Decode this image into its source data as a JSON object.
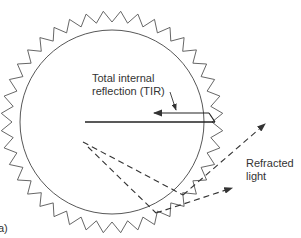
{
  "diagram": {
    "labels": {
      "tir_line1": "Total internal",
      "tir_line2": "reflection (TIR)",
      "refracted_line1": "Refracted",
      "refracted_line2": "light",
      "panel": "a)"
    },
    "geometry": {
      "center": [
        112,
        122
      ],
      "circle_radius": 92,
      "zigzag_inner_radius": 100,
      "zigzag_outer_radius": 111,
      "zigzag_teeth": 40
    },
    "colors": {
      "stroke": "#333333",
      "background": "#ffffff"
    }
  }
}
